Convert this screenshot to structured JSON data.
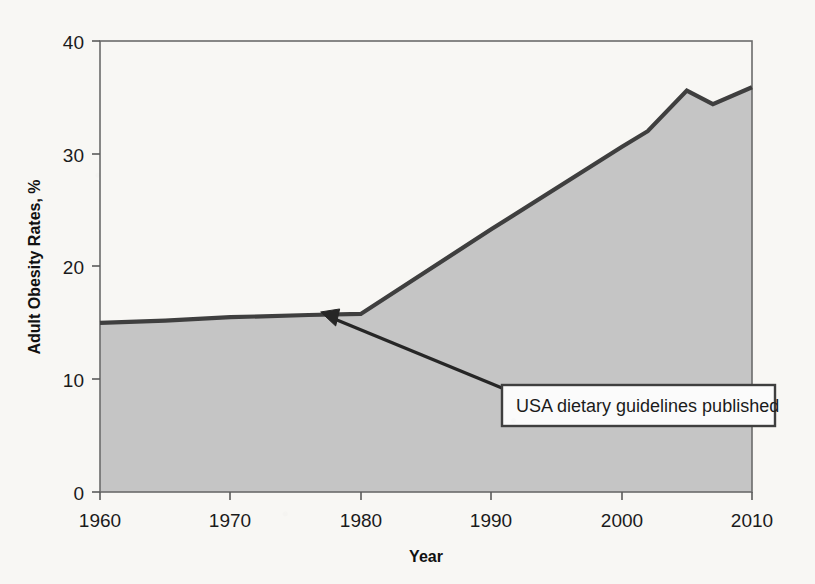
{
  "chart_data": {
    "type": "area",
    "title": "",
    "xlabel": "Year",
    "ylabel": "Adult Obesity Rates, %",
    "xlim": [
      1960,
      2010
    ],
    "ylim": [
      0,
      40
    ],
    "xticks": [
      "1960",
      "1970",
      "1980",
      "1990",
      "2000",
      "2010"
    ],
    "xtick_values": [
      1960,
      1970,
      1980,
      1990,
      2000,
      2010
    ],
    "yticks": [
      "0",
      "10",
      "20",
      "30",
      "40"
    ],
    "ytick_values": [
      0,
      10,
      20,
      30,
      40
    ],
    "grid": false,
    "legend": "none",
    "series": [
      {
        "name": "Adult obesity rate",
        "x": [
          1960,
          1965,
          1970,
          1976,
          1980,
          1990,
          2000,
          2002,
          2005,
          2007,
          2010
        ],
        "values": [
          15.0,
          15.2,
          15.5,
          15.7,
          15.8,
          23.3,
          30.6,
          32.0,
          35.6,
          34.4,
          35.9
        ]
      }
    ],
    "annotations": [
      {
        "text": "USA dietary guidelines published",
        "points_to_x": 1977,
        "points_to_y": 15.7,
        "box_x": 1990.8,
        "box_y": 9.5
      }
    ],
    "colors": {
      "area_fill": "#c5c5c5",
      "line": "#3f3f3f",
      "axis": "#5a5a5a",
      "text": "#1b1b1b",
      "annotation_box_fill": "#fbfbfb",
      "annotation_box_border": "#3f3f3f",
      "background": "#f8f7f4"
    }
  },
  "axes": {
    "y_title": "Adult Obesity Rates, %",
    "x_title": "Year",
    "y_tick_0": "0",
    "y_tick_10": "10",
    "y_tick_20": "20",
    "y_tick_30": "30",
    "y_tick_40": "40",
    "x_tick_1960": "1960",
    "x_tick_1970": "1970",
    "x_tick_1980": "1980",
    "x_tick_1990": "1990",
    "x_tick_2000": "2000",
    "x_tick_2010": "2010"
  },
  "annotation": {
    "label": "USA dietary guidelines published"
  }
}
